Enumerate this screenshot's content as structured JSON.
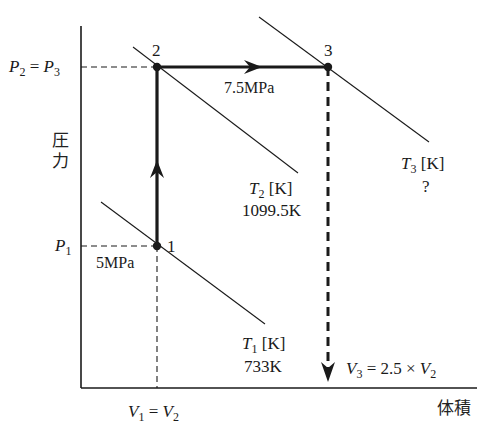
{
  "diagram": {
    "type": "P-V diagram (isotherms)",
    "axes": {
      "y_label": "圧力",
      "y_label_chars": [
        "圧",
        "力"
      ],
      "x_label": "体積"
    },
    "points": [
      {
        "id": "1",
        "label": "1",
        "pressure_label": "5MPa"
      },
      {
        "id": "2",
        "label": "2"
      },
      {
        "id": "3",
        "label": "3"
      }
    ],
    "y_ticks": {
      "p23": {
        "left": "P",
        "left_sub": "2",
        "eq": " = ",
        "right": "P",
        "right_sub": "3"
      },
      "p1": {
        "sym": "P",
        "sub": "1"
      }
    },
    "x_ticks": {
      "v12": {
        "left": "V",
        "left_sub": "1",
        "eq": " = ",
        "right": "V",
        "right_sub": "2"
      }
    },
    "process_labels": {
      "isobaric": "7.5MPa",
      "v3": {
        "sym": "V",
        "sub": "3",
        "expr": " = 2.5 × ",
        "sym2": "V",
        "sub2": "2"
      }
    },
    "isotherms": [
      {
        "id": "T1",
        "sym": "T",
        "sub": "1",
        "unit": " [K]",
        "value": "733K"
      },
      {
        "id": "T2",
        "sym": "T",
        "sub": "2",
        "unit": " [K]",
        "value": "1099.5K"
      },
      {
        "id": "T3",
        "sym": "T",
        "sub": "3",
        "unit": " [K]",
        "value": "?"
      }
    ],
    "colors": {
      "line": "#1a1a1a",
      "background": "#ffffff"
    }
  }
}
